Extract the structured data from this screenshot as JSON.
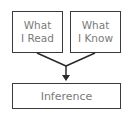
{
  "diagram": {
    "boxes": [
      {
        "line1": "What",
        "line2": "I Read"
      },
      {
        "line1": "What",
        "line2": "I Know"
      },
      {
        "label": "Inference"
      }
    ],
    "colors": {
      "border": "#3a3a3a",
      "text": "#7a7a7a",
      "background": "#ffffff"
    }
  }
}
